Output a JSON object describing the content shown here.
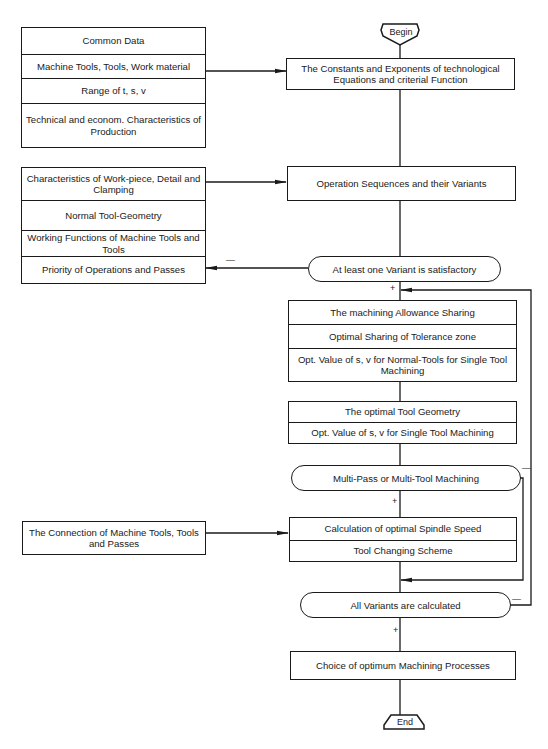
{
  "terminals": {
    "begin": "Begin",
    "end": "End"
  },
  "left_inputs": [
    {
      "id": "general",
      "rows": [
        "Common Data",
        "Machine Tools, Tools, Work material",
        "Range of t, s, v",
        "Technical and econom. Characteristics of Production"
      ]
    },
    {
      "id": "workpiece",
      "rows": [
        "Characteristics of Work-piece, Detail and Clamping",
        "Normal Tool-Geometry",
        "Working Functions of Machine Tools and Tools",
        "Priority of Operations and Passes"
      ]
    },
    {
      "id": "connection",
      "rows": [
        "The Connection of Machine Tools, Tools and Passes"
      ]
    }
  ],
  "main_flow": {
    "constants": "The Constants and Exponents of technological Equations and criterial Function",
    "sequences": "Operation Sequences and their Variants",
    "decision_satisfactory": "At least one Variant is satisfactory",
    "allowance_block": [
      "The machining Allowance Sharing",
      "Optimal Sharing of Tolerance zone",
      "Opt. Value of s, v for Normal-Tools for Single Tool Machining"
    ],
    "geometry_block": [
      "The optimal Tool Geometry",
      "Opt. Value of s, v for Single Tool Machining"
    ],
    "decision_multi": "Multi-Pass or Multi-Tool Machining",
    "spindle_block": [
      "Calculation of optimal Spindle Speed",
      "Tool Changing Scheme"
    ],
    "decision_all": "All Variants are calculated",
    "choice": "Choice of optimum Machining Processes"
  },
  "signs": {
    "plus": "+",
    "minus": "—"
  }
}
